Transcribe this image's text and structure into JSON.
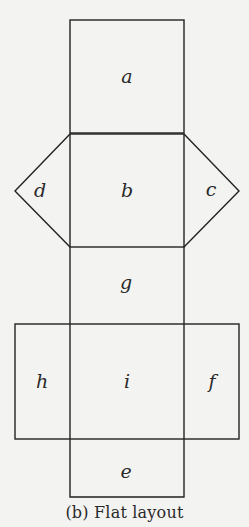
{
  "diagram": {
    "stroke_color": "#222222",
    "background_color": "#f3f3f1",
    "faces": [
      {
        "id": "a",
        "label": "a",
        "shape": "square",
        "position": "top"
      },
      {
        "id": "b",
        "label": "b",
        "shape": "square",
        "position": "upper-center"
      },
      {
        "id": "c",
        "label": "c",
        "shape": "triangle",
        "position": "right-of-b"
      },
      {
        "id": "d",
        "label": "d",
        "shape": "triangle",
        "position": "left-of-b"
      },
      {
        "id": "g",
        "label": "g",
        "shape": "rectangle",
        "position": "center"
      },
      {
        "id": "h",
        "label": "h",
        "shape": "rectangle",
        "position": "left-of-i"
      },
      {
        "id": "i",
        "label": "i",
        "shape": "square",
        "position": "lower-center"
      },
      {
        "id": "f",
        "label": "f",
        "shape": "rectangle",
        "position": "right-of-i"
      },
      {
        "id": "e",
        "label": "e",
        "shape": "rectangle",
        "position": "bottom"
      }
    ]
  },
  "caption": "(b) Flat layout"
}
